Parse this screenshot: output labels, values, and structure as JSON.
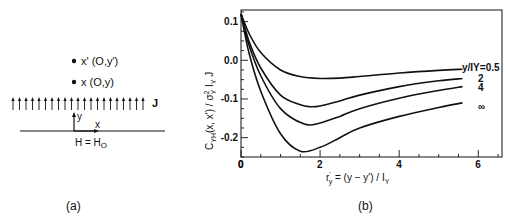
{
  "panel_a": {
    "caption": "(a)",
    "point_upper_label": "x' (O,y')",
    "point_lower_label": "x (O,y)",
    "flux_label": "J",
    "axis_y_label": "y",
    "axis_x_label": "x",
    "boundary_label": "H = H",
    "boundary_sub": "O",
    "arrow_count": 21
  },
  "panel_b": {
    "caption": "(b)"
  },
  "chart_data": {
    "type": "line",
    "title": "",
    "xlabel": "r'_y = (y - y') / I_Y",
    "ylabel": "C_YH(x,x') / σ²_Y I_Y J",
    "xlim": [
      0,
      6.6
    ],
    "ylim": [
      -0.25,
      0.13
    ],
    "xticks": [
      0,
      2,
      4,
      6
    ],
    "yticks": [
      0.1,
      0.0,
      -0.1,
      -0.2
    ],
    "ytick_labels": [
      "0.1",
      "0.0",
      "-0.1",
      "-0.2"
    ],
    "legend_title": "y/I_Y",
    "grid": false,
    "series": [
      {
        "name": "y/I_Y = 0.5",
        "label": "y/IY=0.5",
        "x": [
          0,
          0.2,
          0.5,
          1.0,
          1.5,
          2.0,
          2.5,
          3.0,
          4.0,
          5.0,
          5.6
        ],
        "y": [
          0.12,
          0.07,
          0.02,
          -0.025,
          -0.042,
          -0.047,
          -0.046,
          -0.042,
          -0.033,
          -0.026,
          -0.023
        ]
      },
      {
        "name": "y/I_Y = 2",
        "label": "2",
        "x": [
          0,
          0.2,
          0.5,
          1.0,
          1.5,
          1.75,
          2.0,
          2.5,
          3.0,
          4.0,
          5.0,
          5.6
        ],
        "y": [
          0.12,
          0.05,
          -0.02,
          -0.09,
          -0.115,
          -0.12,
          -0.118,
          -0.105,
          -0.09,
          -0.068,
          -0.053,
          -0.047
        ]
      },
      {
        "name": "y/I_Y = 4",
        "label": "4",
        "x": [
          0,
          0.2,
          0.5,
          1.0,
          1.6,
          2.0,
          2.5,
          3.0,
          4.0,
          5.0,
          5.6
        ],
        "y": [
          0.12,
          0.04,
          -0.04,
          -0.125,
          -0.165,
          -0.162,
          -0.145,
          -0.125,
          -0.098,
          -0.078,
          -0.068
        ]
      },
      {
        "name": "y/I_Y = ∞",
        "label": "∞",
        "x": [
          0,
          0.2,
          0.5,
          1.0,
          1.5,
          2.0,
          2.5,
          3.0,
          4.0,
          5.0,
          5.6
        ],
        "y": [
          0.12,
          0.02,
          -0.08,
          -0.19,
          -0.235,
          -0.225,
          -0.2,
          -0.175,
          -0.145,
          -0.122,
          -0.11
        ]
      }
    ]
  }
}
